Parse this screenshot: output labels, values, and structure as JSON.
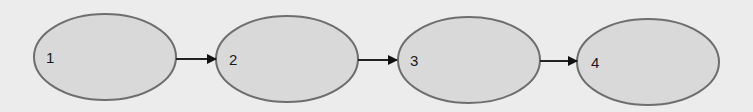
{
  "diagram": {
    "type": "flow",
    "nodes": [
      {
        "id": "1",
        "label": "1"
      },
      {
        "id": "2",
        "label": "2"
      },
      {
        "id": "3",
        "label": "3"
      },
      {
        "id": "4",
        "label": "4"
      }
    ],
    "edges": [
      {
        "from": "1",
        "to": "2"
      },
      {
        "from": "2",
        "to": "3"
      },
      {
        "from": "3",
        "to": "4"
      }
    ],
    "colors": {
      "background": "#ececec",
      "node_fill": "#d9d9d9",
      "node_stroke": "#6e6e6e",
      "arrow": "#111111"
    }
  }
}
